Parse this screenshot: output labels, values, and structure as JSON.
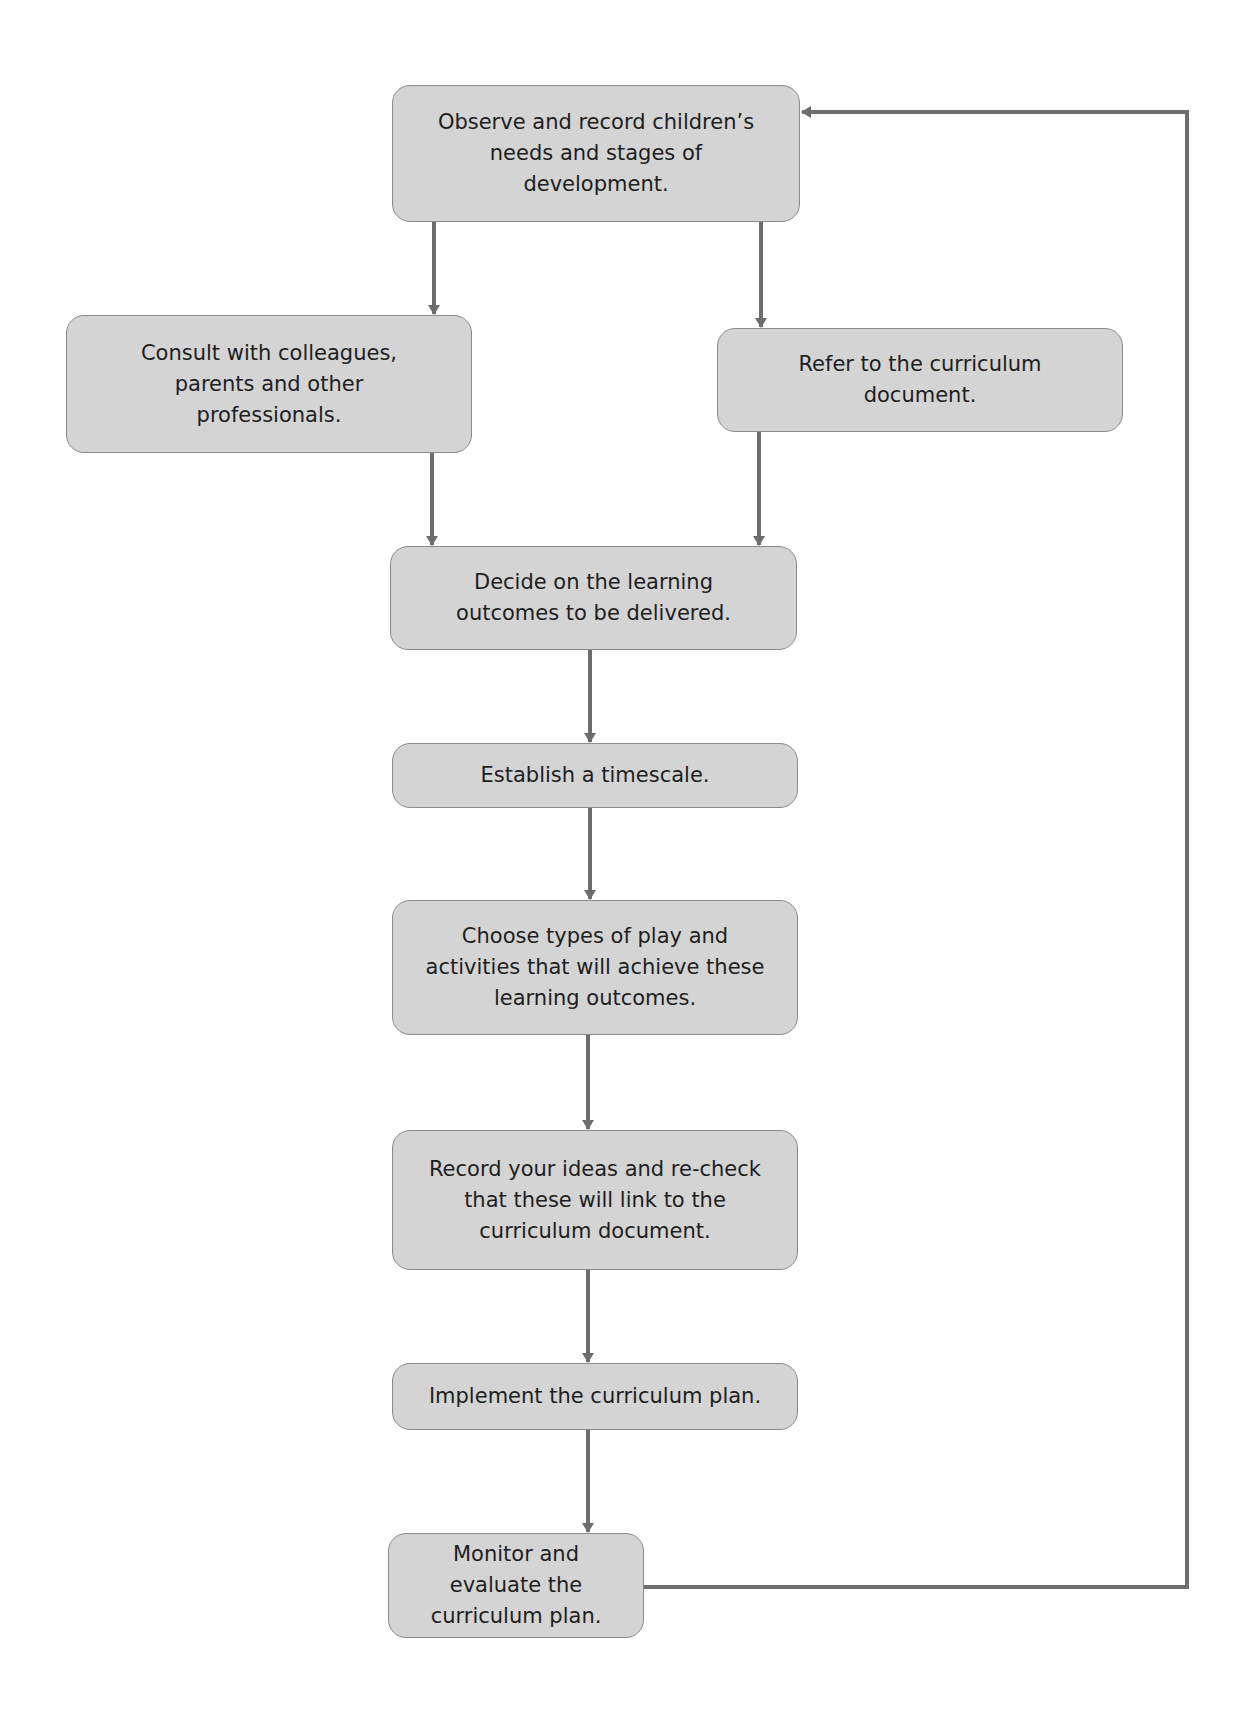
{
  "diagram": {
    "type": "flowchart",
    "colors": {
      "box_fill": "#d4d4d4",
      "box_border": "#8a8a8a",
      "arrow": "#6d6d6d",
      "text": "#1e1e1e"
    },
    "nodes": [
      {
        "id": "observe",
        "text": "Observe and record children’s needs and stages of development."
      },
      {
        "id": "consult",
        "text": "Consult with colleagues, parents and other professionals."
      },
      {
        "id": "refer",
        "text": "Refer to the curriculum document."
      },
      {
        "id": "decide",
        "text": "Decide on the learning outcomes to be delivered."
      },
      {
        "id": "timescale",
        "text": "Establish a timescale."
      },
      {
        "id": "choose",
        "text": "Choose types of play and activities that will achieve these learning outcomes."
      },
      {
        "id": "record",
        "text": "Record your ideas and re-check that these will link to the curriculum document."
      },
      {
        "id": "implement",
        "text": "Implement the curriculum plan."
      },
      {
        "id": "monitor",
        "text": "Monitor and evaluate the curriculum plan."
      }
    ],
    "edges": [
      {
        "from": "observe",
        "to": "consult"
      },
      {
        "from": "observe",
        "to": "refer"
      },
      {
        "from": "consult",
        "to": "decide"
      },
      {
        "from": "refer",
        "to": "decide"
      },
      {
        "from": "decide",
        "to": "timescale"
      },
      {
        "from": "timescale",
        "to": "choose"
      },
      {
        "from": "choose",
        "to": "record"
      },
      {
        "from": "record",
        "to": "implement"
      },
      {
        "from": "implement",
        "to": "monitor"
      },
      {
        "from": "monitor",
        "to": "observe",
        "label": "feedback loop"
      }
    ]
  }
}
